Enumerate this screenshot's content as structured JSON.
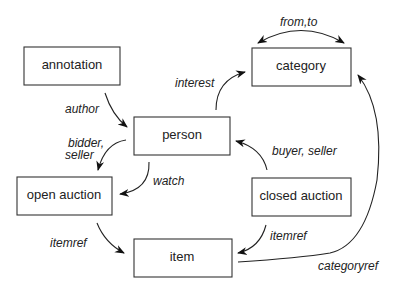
{
  "nodes": {
    "annotation": "annotation",
    "category": "category",
    "person": "person",
    "open_auction": "open auction",
    "closed_auction": "closed auction",
    "item": "item"
  },
  "edges": {
    "from_to": "from,to",
    "interest": "interest",
    "author": "author",
    "bidder_line1": "bidder,",
    "bidder_line2": "seller",
    "watch": "watch",
    "buyer_seller": "buyer, seller",
    "itemref_open": "itemref",
    "itemref_closed": "itemref",
    "categoryref": "categoryref"
  }
}
